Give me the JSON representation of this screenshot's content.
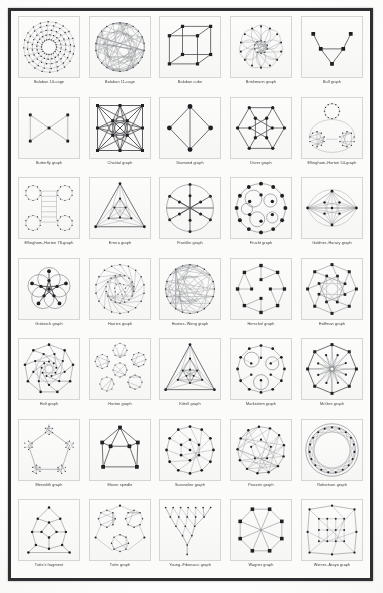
{
  "page": {
    "kind": "scanned-figure-page",
    "layout": {
      "columns": 5,
      "rows": 7,
      "cells": 35
    },
    "colors": {
      "paper": "#fbfbfa",
      "frame": "#2f2f31",
      "cell_border": "#d5d5d3",
      "ink": "#202024",
      "line": "#55565a"
    }
  },
  "figures": [
    {
      "label": "Balaban 10-cage",
      "kind": "radial-cage"
    },
    {
      "label": "Balaban 11-cage",
      "kind": "dense-disc"
    },
    {
      "label": "Balaban cube",
      "kind": "cube"
    },
    {
      "label": "Brinkmann graph",
      "kind": "petal-rosette"
    },
    {
      "label": "Bull graph",
      "kind": "bull"
    },
    {
      "label": "Butterfly graph",
      "kind": "butterfly"
    },
    {
      "label": "Chvátal graph",
      "kind": "chvatal"
    },
    {
      "label": "Diamond graph",
      "kind": "diamond"
    },
    {
      "label": "Dürer graph",
      "kind": "durer"
    },
    {
      "label": "Ellingham–Horton 54-graph",
      "kind": "eh54"
    },
    {
      "label": "Ellingham–Horton 78-graph",
      "kind": "eh78"
    },
    {
      "label": "Errera graph",
      "kind": "errera"
    },
    {
      "label": "Franklin graph",
      "kind": "franklin"
    },
    {
      "label": "Frucht graph",
      "kind": "frucht"
    },
    {
      "label": "Goldner–Harary graph",
      "kind": "goldner"
    },
    {
      "label": "Grötzsch graph",
      "kind": "grotzsch"
    },
    {
      "label": "Harries graph",
      "kind": "harries"
    },
    {
      "label": "Harries–Wong graph",
      "kind": "harries-wong"
    },
    {
      "label": "Herschel graph",
      "kind": "herschel"
    },
    {
      "label": "Hoffman graph",
      "kind": "hoffman"
    },
    {
      "label": "Holt graph",
      "kind": "holt"
    },
    {
      "label": "Horton graph",
      "kind": "horton"
    },
    {
      "label": "Kittell graph",
      "kind": "kittell"
    },
    {
      "label": "Markström graph",
      "kind": "markstrom"
    },
    {
      "label": "McGee graph",
      "kind": "mcgee"
    },
    {
      "label": "Meredith graph",
      "kind": "meredith"
    },
    {
      "label": "Moser spindle",
      "kind": "moser"
    },
    {
      "label": "Sousselier graph",
      "kind": "sousselier"
    },
    {
      "label": "Poussin graph",
      "kind": "poussin"
    },
    {
      "label": "Robertson graph",
      "kind": "robertson"
    },
    {
      "label": "Tutte's fragment",
      "kind": "tutte-fragment"
    },
    {
      "label": "Tutte graph",
      "kind": "tutte"
    },
    {
      "label": "Young–Fibonacci graph",
      "kind": "young-fibonacci"
    },
    {
      "label": "Wagner graph",
      "kind": "wagner"
    },
    {
      "label": "Wiener–Araya graph",
      "kind": "wiener-araya"
    }
  ]
}
